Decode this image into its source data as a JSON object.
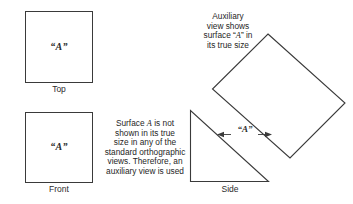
{
  "diagram": {
    "type": "orthographic-projection-with-auxiliary-view",
    "background_color": "#ffffff",
    "line_color": "#3a3a3a",
    "text_color": "#262626"
  },
  "views": {
    "top": {
      "caption": "Top",
      "surface_label": "“A”",
      "shape": "square"
    },
    "front": {
      "caption": "Front",
      "surface_label": "“A”",
      "shape": "square"
    },
    "side": {
      "caption": "Side",
      "shape": "right-triangle"
    },
    "auxiliary": {
      "shape": "rotated-square",
      "caption": ""
    }
  },
  "annotations": {
    "auxiliary_note": {
      "lines": [
        "Auxiliary",
        "view shows",
        "surface “A” in",
        "its true size"
      ],
      "line1": "Auxiliary",
      "line2": "view shows",
      "line3_pre": "surface “",
      "line3_italic": "A",
      "line3_post": "” in",
      "line4": "its true size"
    },
    "surface_note": {
      "lines": [
        "Surface A is not",
        "shown in its true",
        "size in any of the",
        "standard orthographic",
        "views. Therefore, an",
        "auxiliary view is used"
      ],
      "line1_pre": "Surface ",
      "line1_italic": "A",
      "line1_post": " is not",
      "line2": "shown in its true",
      "line3": "size in any of the",
      "line4": "standard orthographic",
      "line5": "views. Therefore, an",
      "line6": "auxiliary view is used"
    },
    "dimension": {
      "label": "“A”",
      "style": "double-headed-arrow"
    }
  }
}
